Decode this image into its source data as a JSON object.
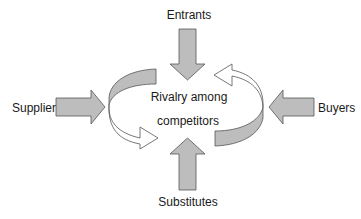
{
  "diagram": {
    "center": {
      "line1": "Rivalry among",
      "line2": "competitors"
    },
    "forces": {
      "top": "Entrants",
      "bottom": "Substitutes",
      "left": "Suppliers",
      "right": "Buyers"
    },
    "colors": {
      "arrow_fill": "#bdbdbd",
      "stroke": "#555555",
      "text": "#1a1a1a",
      "background": "#ffffff"
    }
  }
}
